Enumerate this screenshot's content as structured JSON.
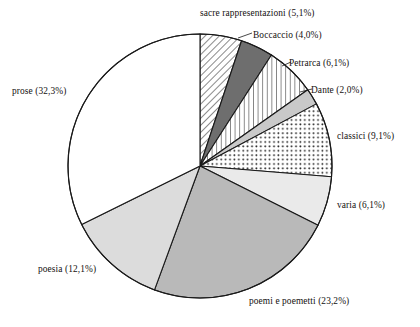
{
  "chart_data": {
    "type": "pie",
    "title": "",
    "subtitle": "",
    "xlabel": "",
    "ylabel": "",
    "legend_position": "callout-labels",
    "grid": false,
    "start_angle_deg": 0,
    "direction": "clockwise",
    "value_unit": "%",
    "categories": [
      "sacre rappresentazioni",
      "Boccaccio",
      "Petrarca",
      "Dante",
      "classici",
      "varia",
      "poemi e poemetti",
      "poesia",
      "prose"
    ],
    "values": [
      5.1,
      4.0,
      6.1,
      2.0,
      9.1,
      6.1,
      23.2,
      12.1,
      32.3
    ],
    "slices": [
      {
        "label": "sacre rappresentazioni",
        "value": 5.1,
        "label_text": "sacre rappresentazioni (5,1%)",
        "fill": "diagonal-hatch",
        "color": "#ffffff"
      },
      {
        "label": "Boccaccio",
        "value": 4.0,
        "label_text": "Boccaccio (4,0%)",
        "fill": "solid",
        "color": "#6e6e6e"
      },
      {
        "label": "Petrarca",
        "value": 6.1,
        "label_text": "Petrarca (6,1%)",
        "fill": "vertical-lines",
        "color": "#ffffff"
      },
      {
        "label": "Dante",
        "value": 2.0,
        "label_text": "Dante (2,0%)",
        "fill": "solid",
        "color": "#c9c9c9"
      },
      {
        "label": "classici",
        "value": 9.1,
        "label_text": "classici (9,1%)",
        "fill": "dots",
        "color": "#ffffff"
      },
      {
        "label": "varia",
        "value": 6.1,
        "label_text": "varia (6,1%)",
        "fill": "solid",
        "color": "#eaeaea"
      },
      {
        "label": "poemi e poemetti",
        "value": 23.2,
        "label_text": "poemi e poemetti (23,2%)",
        "fill": "solid",
        "color": "#b9b9b9"
      },
      {
        "label": "poesia",
        "value": 12.1,
        "label_text": "poesia (12,1%)",
        "fill": "solid",
        "color": "#dcdcdc"
      },
      {
        "label": "prose",
        "value": 32.3,
        "label_text": "prose (32,3%)",
        "fill": "solid",
        "color": "#ffffff"
      }
    ],
    "stroke_color": "#1a1a1a",
    "background": "#ffffff"
  }
}
